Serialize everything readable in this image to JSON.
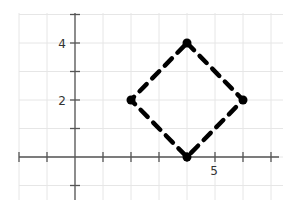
{
  "chart_data": {
    "type": "line",
    "title": "",
    "xlabel": "",
    "ylabel": "",
    "xlim": [
      -2,
      7.4
    ],
    "ylim": [
      -1.5,
      5
    ],
    "grid": true,
    "legend": null,
    "x_tick_labels": [
      {
        "value": 5,
        "label": "5"
      }
    ],
    "y_tick_labels": [
      {
        "value": 2,
        "label": "2"
      },
      {
        "value": 4,
        "label": "4"
      }
    ],
    "x_ticks": [
      -2,
      -1,
      1,
      2,
      3,
      4,
      5,
      6,
      7
    ],
    "y_ticks": [
      -1,
      1,
      2,
      3,
      4,
      5
    ],
    "series": [
      {
        "name": "square",
        "style": "dashed",
        "closed": true,
        "color": "#000000",
        "points": [
          [
            4,
            4
          ],
          [
            6,
            2
          ],
          [
            4,
            0
          ],
          [
            2,
            2
          ]
        ]
      }
    ]
  },
  "colors": {
    "grid": "#e6e6e6",
    "axis": "#555555",
    "shape": "#000000"
  }
}
